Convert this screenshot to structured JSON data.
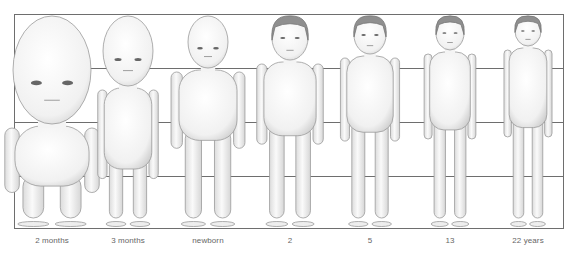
{
  "frame": {
    "line_color": "#6e6e6e",
    "background": "#ffffff",
    "gridlines_y": [
      68,
      122,
      176
    ]
  },
  "figures": [
    {
      "id": "2-months",
      "label": "2 months",
      "center_x": 52,
      "head_top": 16,
      "head_h": 108,
      "head_w": 78,
      "feet_y": 226
    },
    {
      "id": "3-months",
      "label": "3 months",
      "center_x": 128,
      "head_top": 16,
      "head_h": 70,
      "head_w": 50,
      "feet_y": 226
    },
    {
      "id": "newborn",
      "label": "newborn",
      "center_x": 208,
      "head_top": 16,
      "head_h": 52,
      "head_w": 40,
      "feet_y": 226
    },
    {
      "id": "2",
      "label": "2",
      "center_x": 290,
      "head_top": 16,
      "head_h": 44,
      "head_w": 36,
      "feet_y": 226
    },
    {
      "id": "5",
      "label": "5",
      "center_x": 370,
      "head_top": 16,
      "head_h": 38,
      "head_w": 32,
      "feet_y": 226
    },
    {
      "id": "13",
      "label": "13",
      "center_x": 450,
      "head_top": 16,
      "head_h": 34,
      "head_w": 28,
      "feet_y": 226
    },
    {
      "id": "22-years",
      "label": "22 years",
      "center_x": 528,
      "head_top": 16,
      "head_h": 30,
      "head_w": 26,
      "feet_y": 226
    }
  ],
  "labels": [
    "2 months",
    "3 months",
    "newborn",
    "2",
    "5",
    "13",
    "22 years"
  ]
}
